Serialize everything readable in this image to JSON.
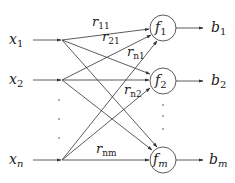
{
  "diagram": {
    "type": "bipartite network",
    "colors": {
      "line": "#333333",
      "text": "#222222",
      "background": "#ffffff"
    },
    "inputs": [
      {
        "id": "x1",
        "base": "x",
        "sub": "1",
        "y": 40
      },
      {
        "id": "x2",
        "base": "x",
        "sub": "2",
        "y": 80
      },
      {
        "id": "xn",
        "base": "x",
        "sub": "n",
        "y": 160
      }
    ],
    "functions": [
      {
        "id": "f1",
        "base": "f",
        "sub": "1",
        "cy": 28
      },
      {
        "id": "f2",
        "base": "f",
        "sub": "2",
        "cy": 81
      },
      {
        "id": "fm",
        "base": "f",
        "sub": "m",
        "cy": 160
      }
    ],
    "outputs": [
      {
        "id": "b1",
        "base": "b",
        "sub": "1"
      },
      {
        "id": "b2",
        "base": "b",
        "sub": "2"
      },
      {
        "id": "bm",
        "base": "b",
        "sub": "m"
      }
    ],
    "edge_labels": [
      {
        "id": "r11",
        "base": "r",
        "sub": "11"
      },
      {
        "id": "r21",
        "base": "r",
        "sub": "21"
      },
      {
        "id": "rn1",
        "base": "r",
        "sub": "n1"
      },
      {
        "id": "rn2",
        "base": "r",
        "sub": "n2"
      },
      {
        "id": "rnm",
        "base": "r",
        "sub": "nm"
      }
    ],
    "ellipsis": ". . ."
  }
}
